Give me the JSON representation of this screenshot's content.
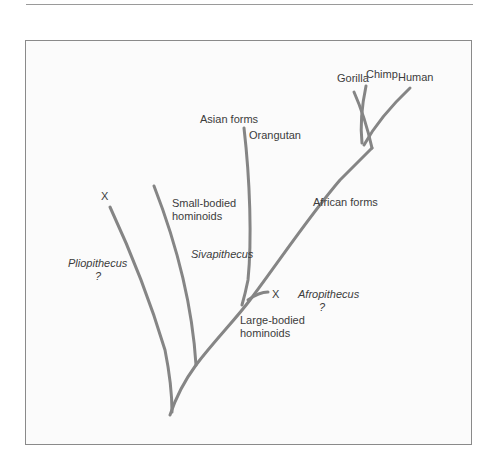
{
  "diagram": {
    "type": "phylogenetic-tree",
    "colors": {
      "branch": "#858585",
      "text": "#3c3c3c",
      "frame": "#8a8a8a"
    },
    "labels": {
      "gorilla": "Gorilla",
      "chimp": "Chimp",
      "human": "Human",
      "asian_forms": "Asian forms",
      "orangutan": "Orangutan",
      "african_forms": "African forms",
      "extinct_marker_left": "X",
      "small_bodied_line1": "Small-bodied",
      "small_bodied_line2": "hominoids",
      "sivapithecus": "Sivapithecus",
      "pliopithecus": "Pliopithecus",
      "pliopithecus_q": "?",
      "extinct_marker_right": "X",
      "afropithecus": "Afropithecus",
      "afropithecus_q": "?",
      "large_bodied_line1": "Large-bodied",
      "large_bodied_line2": "hominoids"
    }
  }
}
